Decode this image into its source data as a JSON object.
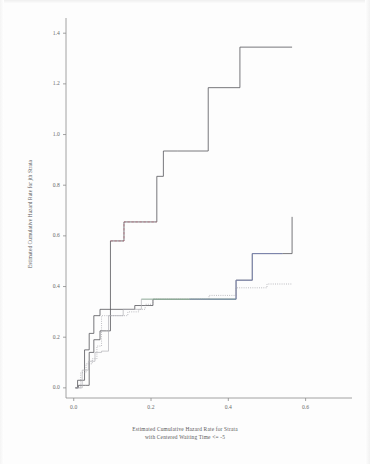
{
  "figure": {
    "background_color": "#fdfdfd",
    "axis_color": "#8c8c8c",
    "text_color": "#5a5a5a"
  },
  "chart_data": {
    "type": "line",
    "title": "",
    "subtitle": "",
    "xlabel_line1": "Estimated Cumulative Hazard Rate for Strata",
    "xlabel_line2": "with Centered Waiting Time <= -5",
    "ylabel": "Estimated Cumulative Hazard Rate for jth Strata",
    "xlim": [
      -0.02,
      0.72
    ],
    "ylim": [
      -0.04,
      1.46
    ],
    "xticks": [
      0.0,
      0.2,
      0.4,
      0.6
    ],
    "xtick_labels": [
      "0.0",
      "0.2",
      "0.4",
      "0.6"
    ],
    "yticks": [
      0.0,
      0.2,
      0.4,
      0.6,
      0.8,
      1.0,
      1.2,
      1.4
    ],
    "ytick_labels": [
      "0.0",
      "0.2",
      "0.4",
      "0.6",
      "0.8",
      "1.0",
      "1.2",
      "1.4"
    ],
    "grid": false,
    "legend": "none",
    "step_style": "post",
    "series": [
      {
        "name": "curve-high-black",
        "color": "#55555a",
        "dash": "solid",
        "width": 0.8,
        "x": [
          0.005,
          0.012,
          0.03,
          0.04,
          0.052,
          0.068,
          0.085,
          0.095,
          0.095,
          0.13,
          0.13,
          0.215,
          0.215,
          0.232,
          0.232,
          0.268,
          0.268,
          0.348,
          0.348,
          0.43,
          0.43,
          0.565
        ],
        "y": [
          0.0,
          0.01,
          0.01,
          0.14,
          0.19,
          0.225,
          0.225,
          0.225,
          0.58,
          0.58,
          0.655,
          0.655,
          0.835,
          0.835,
          0.935,
          0.935,
          0.935,
          0.935,
          1.185,
          1.185,
          1.345,
          1.345
        ]
      },
      {
        "name": "curve-high-reddash",
        "color": "#b46b7a",
        "dash": "dashed",
        "width": 0.7,
        "x": [
          0.095,
          0.13,
          0.13,
          0.215
        ],
        "y": [
          0.58,
          0.58,
          0.655,
          0.655
        ]
      },
      {
        "name": "curve-mid-black",
        "color": "#55555a",
        "dash": "solid",
        "width": 0.8,
        "x": [
          0.004,
          0.01,
          0.01,
          0.028,
          0.028,
          0.04,
          0.04,
          0.052,
          0.052,
          0.068,
          0.068,
          0.095,
          0.095,
          0.158,
          0.158,
          0.205,
          0.205,
          0.3,
          0.3,
          0.42,
          0.42,
          0.462,
          0.462,
          0.54,
          0.54,
          0.565
        ],
        "y": [
          0.0,
          0.0,
          0.03,
          0.03,
          0.15,
          0.15,
          0.215,
          0.215,
          0.285,
          0.285,
          0.31,
          0.31,
          0.31,
          0.31,
          0.325,
          0.325,
          0.35,
          0.35,
          0.35,
          0.35,
          0.425,
          0.425,
          0.53,
          0.53,
          0.53,
          0.675
        ]
      },
      {
        "name": "curve-mid-green",
        "color": "#7fbb8f",
        "dash": "solid",
        "width": 0.8,
        "x": [
          0.175,
          0.205,
          0.205,
          0.3,
          0.3,
          0.42
        ],
        "y": [
          0.35,
          0.35,
          0.35,
          0.35,
          0.35,
          0.35
        ]
      },
      {
        "name": "curve-mid-blue",
        "color": "#7b86b8",
        "dash": "solid",
        "width": 0.8,
        "x": [
          0.3,
          0.42,
          0.42,
          0.462,
          0.462,
          0.54
        ],
        "y": [
          0.35,
          0.35,
          0.425,
          0.425,
          0.53,
          0.53
        ]
      },
      {
        "name": "curve-low-dotted",
        "color": "#9a9aa0",
        "dash": "dotted",
        "width": 0.7,
        "x": [
          0.004,
          0.018,
          0.018,
          0.032,
          0.032,
          0.048,
          0.048,
          0.06,
          0.06,
          0.072,
          0.072,
          0.095,
          0.095,
          0.14,
          0.14,
          0.168,
          0.168,
          0.185,
          0.185,
          0.205,
          0.205,
          0.3,
          0.3,
          0.35,
          0.35,
          0.42,
          0.42,
          0.5,
          0.5,
          0.565
        ],
        "y": [
          0.0,
          0.0,
          0.06,
          0.06,
          0.095,
          0.095,
          0.115,
          0.115,
          0.165,
          0.165,
          0.285,
          0.285,
          0.285,
          0.285,
          0.3,
          0.3,
          0.31,
          0.31,
          0.33,
          0.33,
          0.35,
          0.35,
          0.35,
          0.35,
          0.365,
          0.365,
          0.395,
          0.395,
          0.41,
          0.41
        ]
      },
      {
        "name": "curve-low-faint",
        "color": "#b0b0b6",
        "dash": "solid",
        "width": 0.7,
        "x": [
          0.006,
          0.022,
          0.022,
          0.038,
          0.038,
          0.055,
          0.055,
          0.072,
          0.072,
          0.09,
          0.09,
          0.128,
          0.128,
          0.175,
          0.175,
          0.205
        ],
        "y": [
          0.0,
          0.0,
          0.07,
          0.07,
          0.105,
          0.105,
          0.14,
          0.14,
          0.145,
          0.145,
          0.285,
          0.285,
          0.31,
          0.31,
          0.35,
          0.35
        ]
      }
    ]
  }
}
